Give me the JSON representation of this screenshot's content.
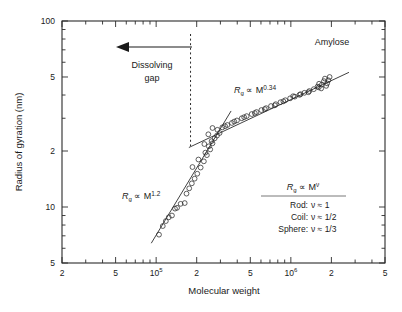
{
  "chart_data": {
    "type": "scatter",
    "title": "",
    "series_label": "Amylose",
    "xlabel": "Molecular weight",
    "ylabel": "Radius of gyration (nm)",
    "xscale": "log",
    "yscale": "log",
    "xlim": [
      20000,
      5000000
    ],
    "ylim": [
      5,
      100
    ],
    "grid": false,
    "legend_position": "inside-bottom-right",
    "xticks": [
      {
        "value": 20000,
        "label": "2",
        "sup": ""
      },
      {
        "value": 50000,
        "label": "5",
        "sup": ""
      },
      {
        "value": 100000,
        "label": "10",
        "sup": "5"
      },
      {
        "value": 200000,
        "label": "2",
        "sup": ""
      },
      {
        "value": 500000,
        "label": "5",
        "sup": ""
      },
      {
        "value": 1000000,
        "label": "10",
        "sup": "6"
      },
      {
        "value": 2000000,
        "label": "2",
        "sup": ""
      },
      {
        "value": 5000000,
        "label": "5",
        "sup": ""
      }
    ],
    "yticks": [
      {
        "value": 5,
        "label": "5"
      },
      {
        "value": 10,
        "label": "10"
      },
      {
        "value": 20,
        "label": "2"
      },
      {
        "value": 50,
        "label": "5"
      },
      {
        "value": 100,
        "label": "100"
      }
    ],
    "series": [
      {
        "name": "Amylose",
        "marker": "open-circle",
        "points": [
          [
            105000,
            7.1
          ],
          [
            112000,
            7.9
          ],
          [
            118000,
            8.4
          ],
          [
            124000,
            8.8
          ],
          [
            131000,
            9.0
          ],
          [
            138000,
            9.8
          ],
          [
            143000,
            9.9
          ],
          [
            152000,
            10.4
          ],
          [
            163000,
            10.5
          ],
          [
            168000,
            11.8
          ],
          [
            176000,
            12.6
          ],
          [
            184000,
            13.4
          ],
          [
            193000,
            14.2
          ],
          [
            202000,
            15.1
          ],
          [
            214000,
            16.3
          ],
          [
            226000,
            17.6
          ],
          [
            238000,
            19.0
          ],
          [
            252000,
            20.4
          ],
          [
            262000,
            22.0
          ],
          [
            272000,
            23.4
          ],
          [
            283000,
            24.2
          ],
          [
            296000,
            25.0
          ],
          [
            232000,
            19.6
          ],
          [
            246000,
            21.2
          ],
          [
            258000,
            22.6
          ],
          [
            186000,
            16.4
          ],
          [
            206000,
            18.0
          ],
          [
            228000,
            21.8
          ],
          [
            244000,
            24.6
          ],
          [
            262000,
            26.6
          ],
          [
            285000,
            26.0
          ],
          [
            310000,
            26.8
          ],
          [
            338000,
            27.6
          ],
          [
            365000,
            28.3
          ],
          [
            398000,
            29.2
          ],
          [
            432000,
            30.0
          ],
          [
            470000,
            30.8
          ],
          [
            512000,
            31.6
          ],
          [
            556000,
            32.4
          ],
          [
            604000,
            33.2
          ],
          [
            655000,
            34.0
          ],
          [
            712000,
            34.9
          ],
          [
            772000,
            35.7
          ],
          [
            838000,
            36.6
          ],
          [
            910000,
            37.5
          ],
          [
            988000,
            38.4
          ],
          [
            1070000,
            39.2
          ],
          [
            1160000,
            40.1
          ],
          [
            1260000,
            41.1
          ],
          [
            1370000,
            42.0
          ],
          [
            1480000,
            43.0
          ],
          [
            1610000,
            44.0
          ],
          [
            1700000,
            45.5
          ],
          [
            1760000,
            47.5
          ],
          [
            1790000,
            49.0
          ],
          [
            1830000,
            44.8
          ],
          [
            1860000,
            46.2
          ],
          [
            1900000,
            48.0
          ],
          [
            1940000,
            50.0
          ],
          [
            1680000,
            43.4
          ],
          [
            1620000,
            46.0
          ],
          [
            1580000,
            44.4
          ],
          [
            1350000,
            41.4
          ],
          [
            1180000,
            40.4
          ],
          [
            1040000,
            39.4
          ],
          [
            880000,
            37.0
          ],
          [
            760000,
            35.2
          ],
          [
            640000,
            33.6
          ],
          [
            540000,
            32.0
          ],
          [
            450000,
            30.4
          ],
          [
            380000,
            28.8
          ],
          [
            325000,
            27.2
          ]
        ]
      }
    ],
    "fits": [
      {
        "name": "rod-regime-fit",
        "exponent": 1.2,
        "label_base": "R",
        "label_sub": "g",
        "label_prop": "∝",
        "label_var": "M",
        "label_exp": "1.2",
        "x_start": 92000,
        "x_end": 360000
      },
      {
        "name": "coil-regime-fit",
        "exponent": 0.34,
        "label_base": "R",
        "label_sub": "g",
        "label_prop": "∝",
        "label_var": "M",
        "label_exp": "0.34",
        "x_start": 175000,
        "x_end": 2700000
      }
    ],
    "annotations": [
      {
        "name": "dissolving-gap",
        "line1": "Dissolving",
        "line2": "gap",
        "arrow_direction": "left",
        "dashed_line_x": 180000
      },
      {
        "name": "series-name",
        "text": "Amylose"
      }
    ],
    "legend": {
      "header_base": "R",
      "header_sub": "g",
      "header_prop": "∝",
      "header_var": "M",
      "header_exp": "ν",
      "rows": [
        {
          "shape": "Rod:",
          "relation": "ν ≈ 1"
        },
        {
          "shape": "Coil:",
          "relation": "ν ≈ 1/2"
        },
        {
          "shape": "Sphere:",
          "relation": "ν ≈ 1/3"
        }
      ]
    },
    "colors": {
      "ink": "#2b2b2b",
      "background": "#ffffff"
    }
  }
}
